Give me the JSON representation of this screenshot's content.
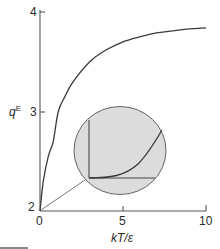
{
  "chart_data": {
    "type": "line",
    "title": "",
    "xlabel": "kT/ε",
    "ylabel": "qᴱ",
    "ylabel_base": "q",
    "ylabel_sup": "E",
    "xlim": [
      0,
      10
    ],
    "ylim": [
      2,
      4
    ],
    "x_ticks": [
      0,
      5,
      10
    ],
    "y_ticks": [
      2,
      3,
      4
    ],
    "x_tick_labels": [
      "0",
      "5",
      "10"
    ],
    "y_tick_labels": [
      "2",
      "3",
      "4"
    ],
    "grid": false,
    "legend": null,
    "series": [
      {
        "name": "qE",
        "x": [
          0,
          0.2,
          0.5,
          0.8,
          1.1,
          1.5,
          2,
          3,
          4,
          5,
          6,
          7,
          8,
          9,
          10
        ],
        "values": [
          2.0,
          2.3,
          2.55,
          2.7,
          3.0,
          3.15,
          3.3,
          3.5,
          3.62,
          3.7,
          3.75,
          3.79,
          3.81,
          3.83,
          3.84
        ]
      }
    ],
    "annotations": [
      {
        "type": "inset-magnifier",
        "description": "Circular magnified inset of the curve near the origin, showing slow initial rise (flat start) of qE at small kT/ε",
        "fill": "#dcdcdc",
        "leader_line_from": [
          0,
          2
        ]
      }
    ]
  },
  "colors": {
    "curve": "#3a3a3a",
    "axis": "#555555",
    "inset_fill": "#dcdcdc",
    "inset_stroke": "#666666"
  }
}
